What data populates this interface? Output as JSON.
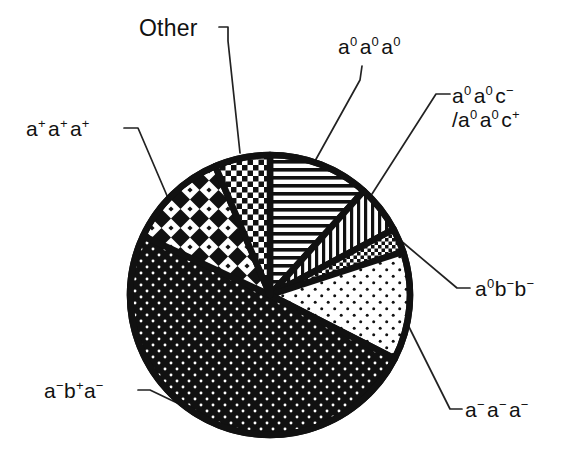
{
  "figure": {
    "background": "#ffffff",
    "ink_color": "#111111"
  },
  "labels": {
    "other": "Other",
    "a0a0a0": "a0a0a0",
    "a0a0c": "a0a0c- /a0a0c+",
    "a0bb": "a0b-b-",
    "aaa": "a-a-a-",
    "appapap": "a+a+a+",
    "abpa": "a-b+a-"
  },
  "chart_data": {
    "type": "pie",
    "title": "",
    "subtitle": "",
    "xlabel": "",
    "ylabel": "",
    "legend_position": "callout-labels",
    "grid": false,
    "center": {
      "x": 270,
      "y": 295
    },
    "radius": 140,
    "start_angle_deg": 0,
    "direction": "clockwise",
    "categories": [
      "a0a0a0",
      "a0a0c- /a0a0c+",
      "a0b-b-",
      "a-a-a-",
      "a-b+a-",
      "a+a+a+",
      "Other"
    ],
    "values": [
      11.7,
      5.6,
      2.8,
      12.5,
      49.4,
      11.7,
      6.3
    ],
    "slices": [
      {
        "label": "a0a0a0",
        "label_html": "a<sup>0</sup>a<sup>0</sup>a<sup>0</sup>",
        "percent": 11.7,
        "start_deg": 0,
        "end_deg": 42,
        "pattern": "horizontal-lines",
        "fill": "#ffffff",
        "stroke": "#111111"
      },
      {
        "label": "a0a0c- /a0a0c+",
        "label_html": "a<sup>0</sup>a<sup>0</sup>c<sup>&minus;</sup> /a<sup>0</sup>a<sup>0</sup>c<sup>+</sup>",
        "percent": 5.6,
        "start_deg": 42,
        "end_deg": 62,
        "pattern": "vertical-lines",
        "fill": "#ffffff",
        "stroke": "#111111"
      },
      {
        "label": "a0b-b-",
        "label_html": "a<sup>0</sup>b<sup>&minus;</sup>b<sup>&minus;</sup>",
        "percent": 2.8,
        "start_deg": 62,
        "end_deg": 72,
        "pattern": "fine-checker",
        "fill": "#ffffff",
        "stroke": "#111111"
      },
      {
        "label": "a-a-a-",
        "label_html": "a<sup>&minus;</sup>a<sup>&minus;</sup>a<sup>&minus;</sup>",
        "percent": 12.5,
        "start_deg": 72,
        "end_deg": 117,
        "pattern": "sparse-dots",
        "fill": "#ffffff",
        "stroke": "#111111"
      },
      {
        "label": "a-b+a-",
        "label_html": "a<sup>&minus;</sup>b<sup>+</sup>a<sup>&minus;</sup>",
        "percent": 49.4,
        "start_deg": 117,
        "end_deg": 295,
        "pattern": "black-with-white-dots",
        "fill": "#111111",
        "stroke": "#111111"
      },
      {
        "label": "a+a+a+",
        "label_html": "a<sup>+</sup>a<sup>+</sup>a<sup>+</sup>",
        "percent": 11.7,
        "start_deg": 295,
        "end_deg": 337,
        "pattern": "large-diamond-checker",
        "fill": "#ffffff",
        "stroke": "#111111"
      },
      {
        "label": "Other",
        "label_html": "Other",
        "percent": 6.3,
        "start_deg": 337,
        "end_deg": 360,
        "pattern": "medium-checker",
        "fill": "#ffffff",
        "stroke": "#111111"
      }
    ]
  }
}
